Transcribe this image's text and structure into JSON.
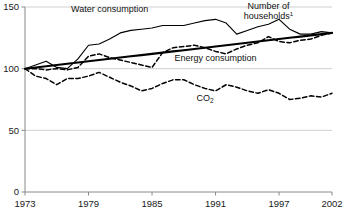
{
  "chart_data": {
    "type": "line",
    "title": "",
    "subtitle": "",
    "xlabel": "",
    "ylabel": "",
    "xlim": [
      1973,
      2002
    ],
    "ylim": [
      0,
      150
    ],
    "grid": true,
    "gridlines_y": [
      50,
      100,
      150
    ],
    "legend_position": "inline-annotations",
    "index_base_note": "Index, 1973 = 100",
    "x": [
      1973,
      1974,
      1975,
      1976,
      1977,
      1978,
      1979,
      1980,
      1981,
      1982,
      1983,
      1984,
      1985,
      1986,
      1987,
      1988,
      1989,
      1990,
      1991,
      1992,
      1993,
      1994,
      1995,
      1996,
      1997,
      1998,
      1999,
      2000,
      2001,
      2002
    ],
    "yticks": [
      0,
      50,
      100,
      150
    ],
    "ytick_labels": [
      "0",
      "50",
      "100",
      "150"
    ],
    "xticks": [
      1973,
      1979,
      1985,
      1991,
      1997,
      2002
    ],
    "xtick_labels": [
      "1973",
      "1979",
      "1985",
      "1991",
      "1997",
      "2002"
    ],
    "series": [
      {
        "name": "Water consumption",
        "style": "solid-thin",
        "label": "Water consumption",
        "label_x": 1981,
        "label_y": 146,
        "values": [
          100,
          103,
          106,
          101,
          100,
          108,
          119,
          120,
          124,
          129,
          131,
          132,
          133,
          135,
          135,
          135,
          137,
          139,
          140,
          137,
          128,
          131,
          134,
          136,
          140,
          132,
          128,
          128,
          130,
          129
        ]
      },
      {
        "name": "Number of households",
        "style": "solid-thick",
        "label": "Number of households",
        "label_line1": "Number of",
        "label_line2": "households",
        "label_superscript": "1",
        "label_x": 1996,
        "label_y": 148,
        "values": [
          100,
          101,
          102,
          103,
          104,
          105,
          106,
          107,
          108,
          109,
          110,
          111,
          112,
          113,
          114,
          115,
          116,
          117,
          118,
          119,
          120,
          121,
          122,
          123,
          124,
          125,
          126,
          127,
          128,
          129
        ]
      },
      {
        "name": "Energy consumption",
        "style": "dashed",
        "label": "Energy consumption",
        "label_x": 1991,
        "label_y": 106,
        "values": [
          100,
          100,
          99,
          100,
          99,
          101,
          110,
          112,
          109,
          107,
          105,
          103,
          101,
          113,
          117,
          118,
          119,
          117,
          114,
          112,
          116,
          119,
          121,
          126,
          122,
          121,
          123,
          124,
          127,
          129
        ]
      },
      {
        "name": "CO2",
        "style": "dashed",
        "label": "CO",
        "label_subscript": "2",
        "label_x": 1990,
        "label_y": 74,
        "values": [
          100,
          94,
          92,
          87,
          92,
          92,
          94,
          97,
          93,
          89,
          86,
          82,
          84,
          88,
          91,
          91,
          87,
          84,
          82,
          87,
          85,
          82,
          80,
          83,
          80,
          75,
          76,
          78,
          77,
          80
        ]
      }
    ]
  },
  "axes": {
    "y_axis_name": "index-axis",
    "x_axis_name": "year-axis"
  }
}
